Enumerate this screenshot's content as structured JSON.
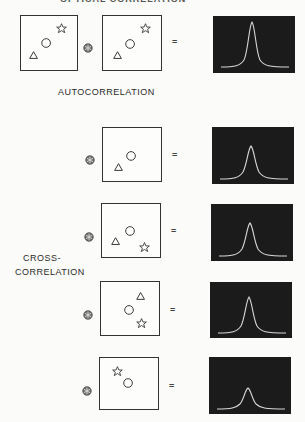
{
  "title_clipped": "OPTICAL CORRELATION",
  "labels": {
    "autocorrelation": "AUTOCORRELATION",
    "cross_line1": "CROSS-",
    "cross_line2": "CORRELATION"
  },
  "operator_symbol": "correlation-operator (circled star)",
  "equals_symbol": "=",
  "rows": [
    {
      "type": "autocorrelation",
      "reference_shapes": [
        "triangle",
        "circle",
        "star"
      ],
      "input_shapes": [
        "triangle",
        "circle",
        "star"
      ],
      "peak_height": 0.98
    },
    {
      "type": "cross-correlation",
      "input_shapes": [
        "triangle",
        "circle"
      ],
      "peak_height": 0.62
    },
    {
      "type": "cross-correlation",
      "input_shapes": [
        "triangle",
        "circle",
        "star"
      ],
      "peak_height": 0.62
    },
    {
      "type": "cross-correlation",
      "input_shapes": [
        "triangle",
        "circle",
        "star"
      ],
      "peak_height": 0.68
    },
    {
      "type": "cross-correlation",
      "input_shapes": [
        "star",
        "circle"
      ],
      "peak_height": 0.38
    }
  ],
  "colors": {
    "plot_bg": "#1b1b1b",
    "curve": "#d8d8d8",
    "outline": "#333333"
  }
}
